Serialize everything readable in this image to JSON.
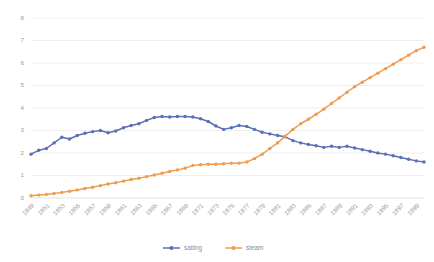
{
  "chart_data": {
    "type": "line",
    "title": "",
    "xlabel": "",
    "ylabel": "",
    "ylim": [
      0,
      8
    ],
    "yticks": [
      0,
      1,
      2,
      3,
      4,
      5,
      6,
      7,
      8
    ],
    "grid": true,
    "legend_position": "bottom",
    "x": [
      1849,
      1850,
      1851,
      1852,
      1853,
      1854,
      1855,
      1856,
      1857,
      1858,
      1859,
      1860,
      1861,
      1862,
      1863,
      1864,
      1865,
      1866,
      1867,
      1868,
      1869,
      1870,
      1871,
      1872,
      1873,
      1874,
      1875,
      1876,
      1877,
      1878,
      1879,
      1880,
      1881,
      1882,
      1883,
      1884,
      1885,
      1886,
      1887,
      1888,
      1889,
      1890,
      1891,
      1892,
      1893,
      1894,
      1895,
      1896,
      1897,
      1898,
      1899,
      1900
    ],
    "xtick_labels": [
      "1849",
      "1851",
      "1853",
      "1855",
      "1857",
      "1859",
      "1861",
      "1863",
      "1865",
      "1867",
      "1869",
      "1871",
      "1873",
      "1875",
      "1877",
      "1879",
      "1881",
      "1883",
      "1885",
      "1887",
      "1889",
      "1891",
      "1893",
      "1895",
      "1897",
      "1899"
    ],
    "series": [
      {
        "name": "sailing",
        "color": "#5B6FB4",
        "marker": "circle",
        "values": [
          1.95,
          2.12,
          2.2,
          2.45,
          2.7,
          2.62,
          2.78,
          2.88,
          2.95,
          3.0,
          2.9,
          2.98,
          3.12,
          3.22,
          3.3,
          3.45,
          3.58,
          3.62,
          3.6,
          3.62,
          3.62,
          3.6,
          3.52,
          3.4,
          3.2,
          3.05,
          3.12,
          3.22,
          3.18,
          3.05,
          2.92,
          2.85,
          2.78,
          2.72,
          2.55,
          2.45,
          2.38,
          2.32,
          2.25,
          2.3,
          2.25,
          2.3,
          2.22,
          2.15,
          2.08,
          2.0,
          1.95,
          1.88,
          1.8,
          1.72,
          1.65,
          1.6
        ]
      },
      {
        "name": "steam",
        "color": "#ED9C50",
        "marker": "circle",
        "values": [
          0.1,
          0.13,
          0.16,
          0.2,
          0.25,
          0.3,
          0.36,
          0.42,
          0.48,
          0.55,
          0.62,
          0.68,
          0.75,
          0.82,
          0.88,
          0.95,
          1.02,
          1.1,
          1.18,
          1.25,
          1.32,
          1.45,
          1.48,
          1.5,
          1.5,
          1.52,
          1.55,
          1.55,
          1.6,
          1.75,
          1.95,
          2.2,
          2.45,
          2.75,
          3.05,
          3.3,
          3.5,
          3.72,
          3.95,
          4.2,
          4.45,
          4.7,
          4.95,
          5.15,
          5.35,
          5.55,
          5.75,
          5.95,
          6.15,
          6.35,
          6.55,
          6.7
        ]
      }
    ]
  }
}
